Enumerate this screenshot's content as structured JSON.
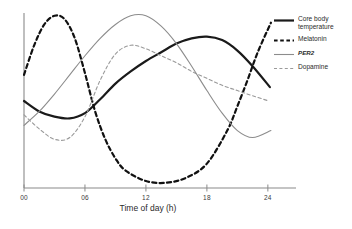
{
  "chart_data": {
    "type": "line",
    "title": "",
    "xlabel": "Time of day (h)",
    "ylabel": "",
    "xlim": [
      0,
      24.8
    ],
    "ylim": [
      0,
      1
    ],
    "grid": false,
    "legend_position": "right",
    "x_ticks": [
      "00",
      "06",
      "12",
      "18",
      "24"
    ],
    "x_tick_values": [
      0,
      6,
      12,
      18,
      24
    ],
    "y_axis_visible": true,
    "y_ticks": [],
    "series": [
      {
        "name": "Core body temperature",
        "style": "solid",
        "color": "#1a1a1a",
        "width": 2.2,
        "x": [
          0,
          1.5,
          3,
          4.5,
          6,
          7.5,
          9,
          10.5,
          12,
          13.5,
          15,
          16.5,
          18,
          19.5,
          21,
          22.5,
          24.2
        ],
        "y": [
          0.5,
          0.44,
          0.41,
          0.4,
          0.43,
          0.51,
          0.6,
          0.67,
          0.73,
          0.78,
          0.83,
          0.86,
          0.87,
          0.85,
          0.79,
          0.7,
          0.58
        ]
      },
      {
        "name": "Melatonin",
        "style": "dashed",
        "color": "#111111",
        "width": 2.2,
        "x": [
          0,
          1,
          2,
          3,
          4,
          5,
          6,
          7,
          8,
          9,
          10,
          12,
          14,
          16,
          18,
          20,
          21,
          22,
          23,
          24.3
        ],
        "y": [
          0.65,
          0.82,
          0.94,
          0.99,
          0.97,
          0.86,
          0.66,
          0.44,
          0.28,
          0.17,
          0.1,
          0.04,
          0.03,
          0.06,
          0.14,
          0.33,
          0.47,
          0.62,
          0.78,
          0.95
        ]
      },
      {
        "name": "PER2",
        "style": "solid",
        "color": "#8c8c8c",
        "width": 1.1,
        "x": [
          0,
          1.5,
          3,
          4.5,
          6,
          7.5,
          9,
          10.5,
          12,
          13.5,
          15,
          16.5,
          18,
          19.5,
          21,
          22.5,
          24.3
        ],
        "y": [
          0.36,
          0.44,
          0.54,
          0.65,
          0.76,
          0.86,
          0.94,
          0.99,
          0.99,
          0.93,
          0.83,
          0.7,
          0.56,
          0.43,
          0.33,
          0.29,
          0.33
        ]
      },
      {
        "name": "Dopamine",
        "style": "dashed",
        "color": "#9a9a9a",
        "width": 1.1,
        "x": [
          0,
          1.5,
          3,
          4.5,
          6,
          7.5,
          9,
          10.5,
          12,
          13.5,
          15,
          16.5,
          18,
          19.5,
          21,
          22.5,
          24.1
        ],
        "y": [
          0.42,
          0.34,
          0.28,
          0.29,
          0.41,
          0.62,
          0.77,
          0.82,
          0.8,
          0.76,
          0.72,
          0.67,
          0.63,
          0.59,
          0.56,
          0.53,
          0.5
        ]
      }
    ],
    "legend": [
      {
        "label": "Core body temperature",
        "style": "solid",
        "color": "#1a1a1a",
        "width": 2.2,
        "italic": false
      },
      {
        "label": "Melatonin",
        "style": "dashed",
        "color": "#111111",
        "width": 2.2,
        "italic": false
      },
      {
        "label": "PER2",
        "style": "solid",
        "color": "#8c8c8c",
        "width": 1.1,
        "italic": true
      },
      {
        "label": "Dopamine",
        "style": "dashed",
        "color": "#9a9a9a",
        "width": 1.1,
        "italic": false
      }
    ]
  },
  "axis": {
    "x_title": "Time of day (h)",
    "tick_labels": [
      "00",
      "06",
      "12",
      "18",
      "24"
    ]
  },
  "colors": {
    "axis": "#8a8a8a",
    "text": "#2b2b2b",
    "background": "#ffffff"
  }
}
